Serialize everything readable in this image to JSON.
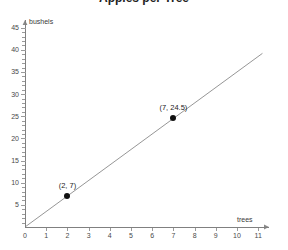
{
  "chart_data": {
    "type": "line",
    "title": "Apples per Tree",
    "xlabel": "trees",
    "ylabel": "bushels",
    "xlim": [
      0,
      11.6
    ],
    "ylim": [
      0,
      46
    ],
    "grid": false,
    "legend": "none",
    "x_ticks": [
      "0",
      "1",
      "2",
      "3",
      "4",
      "5",
      "6",
      "7",
      "8",
      "9",
      "10",
      "11"
    ],
    "x_tick_values": [
      0,
      1,
      2,
      3,
      4,
      5,
      6,
      7,
      8,
      9,
      10,
      11
    ],
    "y_ticks": [
      "5",
      "10",
      "15",
      "20",
      "25",
      "30",
      "35",
      "40",
      "45"
    ],
    "y_tick_values": [
      5,
      10,
      15,
      20,
      25,
      30,
      35,
      40,
      45
    ],
    "y_minor_step": 1,
    "series": [
      {
        "name": "bushels per tree",
        "type": "line",
        "slope": 3.5,
        "intercept": 0,
        "line_from": [
          0,
          0
        ],
        "line_to": [
          11.2,
          39.2
        ],
        "color": "#8a8a8a",
        "points": [
          {
            "x": 2,
            "y": 7,
            "label": "(2, 7)"
          },
          {
            "x": 7,
            "y": 24.5,
            "label": "(7, 24.5)"
          }
        ]
      }
    ],
    "annotations": [
      {
        "text": "(2, 7)",
        "x": 2,
        "y": 7
      },
      {
        "text": "(7, 24.5)",
        "x": 7,
        "y": 24.5
      }
    ]
  },
  "colors": {
    "background": "#ffffff",
    "axis": "#808080",
    "tick": "#9a9a9a",
    "line": "#8a8a8a",
    "point": "#111111",
    "text": "#3a3a3a"
  }
}
